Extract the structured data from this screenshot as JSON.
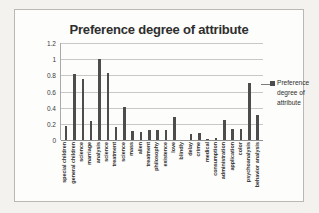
{
  "chart_data": {
    "type": "bar",
    "title": "Preference degree of attribute",
    "xlabel": "",
    "ylabel": "",
    "ylim": [
      0,
      1.2
    ],
    "yticks": [
      "0",
      "0.2",
      "0.4",
      "0.6",
      "0.8",
      "1",
      "1.2"
    ],
    "ytick_values": [
      0,
      0.2,
      0.4,
      0.6,
      0.8,
      1,
      1.2
    ],
    "grid": true,
    "legend_position": "right",
    "legend": [
      "Preference degree of attribute"
    ],
    "categories": [
      "special children",
      "general children",
      "science",
      "marriage",
      "analysis",
      "science",
      "treatment",
      "science",
      "mass",
      "alien",
      "treatment",
      "philosophy",
      "existence",
      "love",
      "blindly",
      "delay",
      "crime",
      "medical",
      "consumption",
      "administration",
      "application",
      "color",
      "psychoanalysis",
      "behavior analysis"
    ],
    "values": [
      0.17,
      0.82,
      0.76,
      0.24,
      1.0,
      0.83,
      0.16,
      0.41,
      0.11,
      0.1,
      0.13,
      0.13,
      0.12,
      0.28,
      0.0,
      0.08,
      0.09,
      0.01,
      0.02,
      0.25,
      0.14,
      0.14,
      0.7,
      0.31
    ],
    "series_name": "Preference degree of attribute",
    "bar_color": "#4d4d4d"
  },
  "legend": {
    "line1": "Preference",
    "line2": "degree of",
    "line3": "attribute"
  }
}
